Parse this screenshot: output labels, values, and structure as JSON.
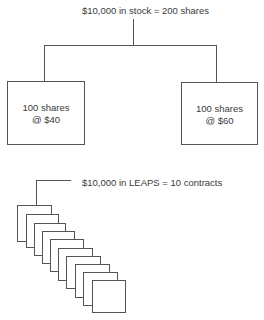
{
  "stock": {
    "title": "$10,000 in stock = 200 shares",
    "left_box": {
      "line1": "100 shares",
      "line2": "@ $40"
    },
    "right_box": {
      "line1": "100 shares",
      "line2": "@ $60"
    }
  },
  "leaps": {
    "title": "$10,000 in LEAPS = 10 contracts",
    "contract_count": 10
  },
  "colors": {
    "line": "#555555",
    "text": "#3a3a3a",
    "background": "#ffffff"
  }
}
